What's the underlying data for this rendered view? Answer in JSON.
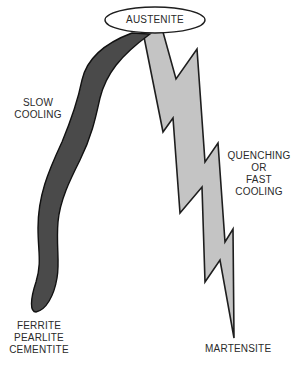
{
  "diagram": {
    "start_node": "AUSTENITE",
    "paths": [
      {
        "name": "slow-cooling",
        "label_lines": [
          "SLOW",
          "COOLING"
        ],
        "shape": "curved band",
        "color": "#4a4a4a",
        "result_lines": [
          "FERRITE",
          "PEARLITE",
          "CEMENTITE"
        ]
      },
      {
        "name": "quenching",
        "label_lines": [
          "QUENCHING",
          "OR",
          "FAST",
          "COOLING"
        ],
        "shape": "lightning bolt",
        "color": "#c4c4c4",
        "result_lines": [
          "MARTENSITE"
        ]
      }
    ]
  }
}
